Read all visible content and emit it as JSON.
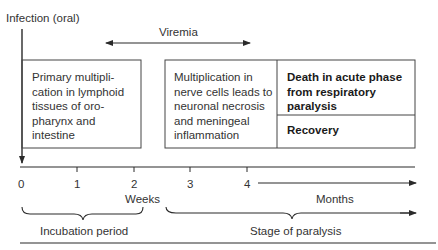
{
  "diagram": {
    "infection_label": "Infection (oral)",
    "viremia_label": "Viremia",
    "boxes": {
      "primary": "Primary multipli-\ncation in lymphoid\ntissues of oro-\npharynx and\nintestine",
      "nerve": "Multiplication in\nnerve cells leads to\nneuronal necrosis\nand meningeal\ninflammation",
      "death": "Death in acute phase\nfrom respiratory\nparalysis",
      "recovery": "Recovery"
    },
    "axis": {
      "ticks": [
        "0",
        "1",
        "2",
        "3",
        "4"
      ],
      "weeks_label": "Weeks",
      "months_label": "Months"
    },
    "periods": {
      "incubation": "Incubation period",
      "paralysis": "Stage of paralysis"
    },
    "colors": {
      "line": "#2a2a2a",
      "text": "#333333",
      "background": "#ffffff"
    }
  }
}
